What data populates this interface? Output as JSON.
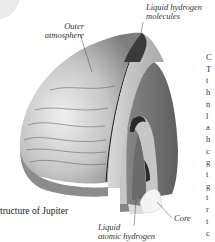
{
  "diagram": {
    "caption_visible": "tructure of Jupiter",
    "labels": {
      "outer_atmosphere": [
        "Outer",
        "atmosphere"
      ],
      "liquid_hydrogen_molecules": [
        "Liquid hydrogen",
        "molecules"
      ],
      "liquid_atomic_hydrogen": [
        "Liquid",
        "atomic hydrogen"
      ],
      "core": "Core"
    },
    "colors": {
      "surface_light": "#e6e6e6",
      "surface_dark": "#7a7a7a",
      "section_dark": "#6b6b6b",
      "section_mid": "#9a9a9a",
      "layer_light": "#c8c8c8",
      "core": "#f2f2f2"
    }
  },
  "side_column": {
    "letters": [
      "C",
      "T",
      "t",
      "h",
      "n",
      "l",
      "a",
      "h",
      "c",
      "g",
      "t",
      "g",
      "t",
      "r",
      "t",
      "c"
    ]
  }
}
